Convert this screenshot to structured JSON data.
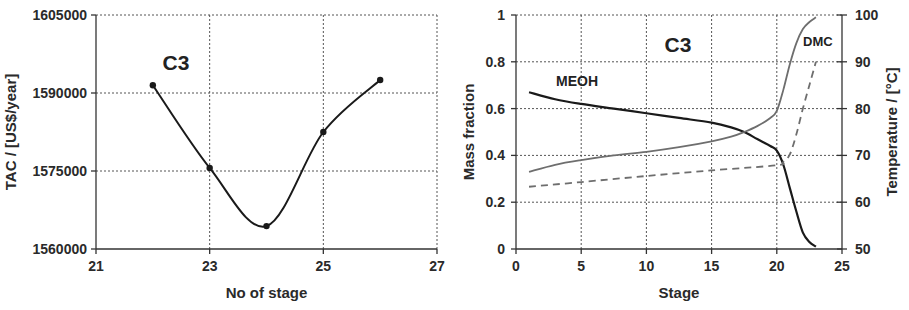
{
  "chart_data": [
    {
      "type": "line",
      "title": "",
      "annotation": "C3",
      "xlabel": "No of stage",
      "ylabel": "TAC / [US$/year]",
      "xlim": [
        21,
        27
      ],
      "ylim": [
        1560000,
        1605000
      ],
      "xticks": [
        21,
        23,
        25,
        27
      ],
      "yticks": [
        1560000,
        1575000,
        1590000,
        1605000
      ],
      "xtick_labels": [
        "21",
        "23",
        "25",
        "27"
      ],
      "ytick_labels": [
        "1560000",
        "1575000",
        "1590000",
        "1605000"
      ],
      "grid": true,
      "series": [
        {
          "name": "TAC",
          "x": [
            22,
            23,
            24,
            25,
            26
          ],
          "values": [
            1591500,
            1575600,
            1564400,
            1582500,
            1592500
          ],
          "color": "#1a1a1a",
          "markers": true,
          "smooth": true
        }
      ]
    },
    {
      "type": "line",
      "title": "",
      "annotation": "C3",
      "xlabel": "Stage",
      "ylabel": "Mass fraction",
      "y2label": "Temperature / [°C]",
      "xlim": [
        0,
        25
      ],
      "ylim": [
        0,
        1
      ],
      "y2lim": [
        50,
        100
      ],
      "xticks": [
        0,
        5,
        10,
        15,
        20,
        25
      ],
      "yticks": [
        0,
        0.2,
        0.4,
        0.6,
        0.8,
        1
      ],
      "y2ticks": [
        50,
        60,
        70,
        80,
        90,
        100
      ],
      "xtick_labels": [
        "0",
        "5",
        "10",
        "15",
        "20",
        "25"
      ],
      "ytick_labels": [
        "0",
        "0.2",
        "0.4",
        "0.6",
        "0.8",
        "1"
      ],
      "y2tick_labels": [
        "50",
        "60",
        "70",
        "80",
        "90",
        "100"
      ],
      "grid": true,
      "series": [
        {
          "name": "MEOH",
          "axis": "left",
          "style": "solid",
          "color": "#1a1a1a",
          "x": [
            1,
            3,
            5,
            7.5,
            10,
            12.5,
            15,
            16.5,
            17.5,
            18.5,
            19.5,
            20,
            20.5,
            21,
            21.5,
            22,
            22.5,
            23
          ],
          "values": [
            0.67,
            0.64,
            0.62,
            0.6,
            0.58,
            0.56,
            0.54,
            0.52,
            0.5,
            0.47,
            0.44,
            0.42,
            0.36,
            0.26,
            0.16,
            0.07,
            0.03,
            0.01
          ]
        },
        {
          "name": "DMC",
          "axis": "left",
          "style": "solid",
          "color": "#6e6e6e",
          "x": [
            1,
            3,
            5,
            7.5,
            10,
            12.5,
            15,
            16.5,
            17.5,
            18.5,
            19.5,
            20,
            20.5,
            21,
            21.5,
            22,
            22.5,
            23
          ],
          "values": [
            0.33,
            0.36,
            0.38,
            0.4,
            0.415,
            0.435,
            0.46,
            0.48,
            0.5,
            0.525,
            0.56,
            0.59,
            0.68,
            0.79,
            0.88,
            0.94,
            0.97,
            0.99
          ]
        },
        {
          "name": "Temperature",
          "axis": "right",
          "style": "dashed",
          "color": "#6e6e6e",
          "x": [
            1,
            5,
            10,
            15,
            20,
            20.5,
            21,
            21.5,
            22,
            22.5,
            23
          ],
          "values": [
            63.3,
            64.3,
            65.6,
            66.8,
            67.9,
            68.6,
            70.2,
            74.5,
            80,
            85,
            90
          ]
        }
      ],
      "labels": [
        {
          "text": "MEOH",
          "series": "MEOH"
        },
        {
          "text": "DMC",
          "series": "DMC"
        }
      ]
    }
  ]
}
